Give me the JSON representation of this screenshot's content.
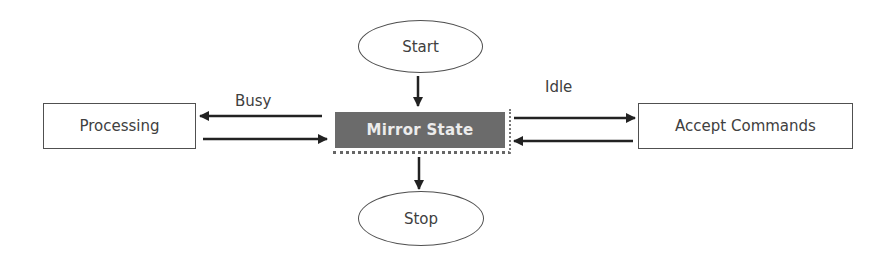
{
  "diagram": {
    "nodes": {
      "start": {
        "label": "Start",
        "shape": "ellipse"
      },
      "stop": {
        "label": "Stop",
        "shape": "ellipse"
      },
      "mirror_state": {
        "label": "Mirror State",
        "shape": "rectangle-filled",
        "fill": "#6b6b6b",
        "text_color": "#ececec"
      },
      "processing": {
        "label": "Processing",
        "shape": "rectangle"
      },
      "accept_commands": {
        "label": "Accept Commands",
        "shape": "rectangle"
      }
    },
    "edge_labels": {
      "busy": "Busy",
      "idle": "Idle"
    },
    "edges": [
      {
        "from": "Start",
        "to": "Mirror State"
      },
      {
        "from": "Mirror State",
        "to": "Stop"
      },
      {
        "from": "Mirror State",
        "to": "Processing",
        "label": "Busy"
      },
      {
        "from": "Processing",
        "to": "Mirror State"
      },
      {
        "from": "Mirror State",
        "to": "Accept Commands",
        "label": "Idle"
      },
      {
        "from": "Accept Commands",
        "to": "Mirror State"
      }
    ],
    "colors": {
      "stroke": "#505050",
      "arrow": "#222222"
    }
  }
}
